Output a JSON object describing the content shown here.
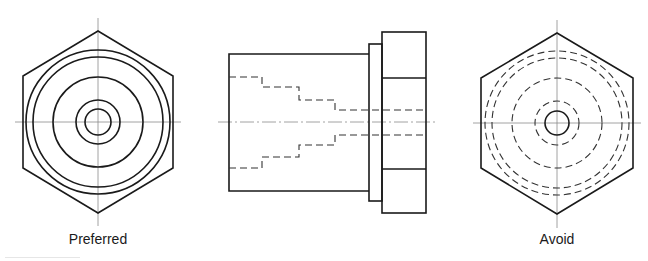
{
  "figure": {
    "views": [
      {
        "id": "end-view-preferred",
        "label": "Preferred",
        "label_x": 98,
        "label_y": 232,
        "center": [
          98,
          122
        ],
        "hex": {
          "top": 31,
          "bottom": 213,
          "left": 23,
          "right": 173,
          "shoulder_top": 76,
          "shoulder_bottom": 168
        },
        "solid_circle_radii": [
          13,
          22,
          45,
          65,
          72
        ],
        "hidden_circle_radii": []
      },
      {
        "id": "side-view",
        "label": ""
      },
      {
        "id": "end-view-avoid",
        "label": "Avoid",
        "label_x": 557,
        "label_y": 232,
        "center": [
          557,
          123
        ],
        "hex": {
          "top": 33,
          "bottom": 214,
          "left": 481,
          "right": 633,
          "shoulder_top": 78,
          "shoulder_bottom": 168
        },
        "solid_circle_radii": [
          12
        ],
        "hidden_circle_radii": [
          22,
          45,
          65,
          72
        ]
      }
    ],
    "colors": {
      "object_line": "#1a1a1a",
      "hidden_line": "#333333",
      "center_line": "#8a8a8a",
      "background": "#ffffff"
    }
  }
}
